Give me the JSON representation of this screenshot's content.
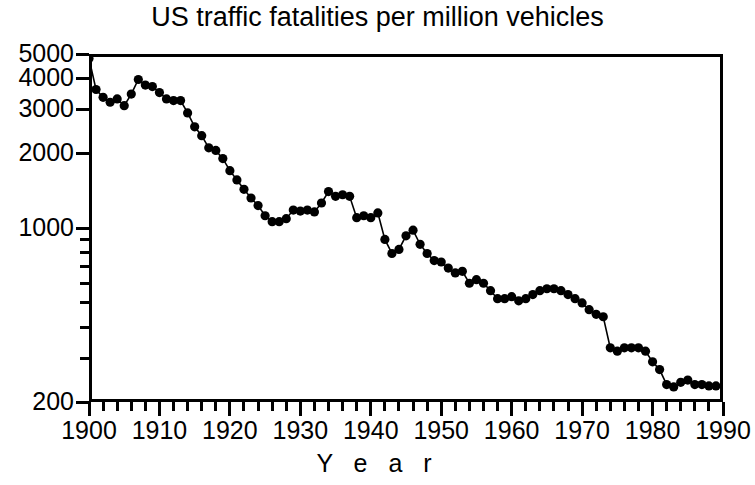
{
  "chart": {
    "title": "US traffic fatalities per million vehicles",
    "xlabel": "Y e a r",
    "ylabel": ""
  },
  "chart_data": {
    "type": "line",
    "title": "US traffic fatalities per million vehicles",
    "xlabel": "Y e a r",
    "ylabel": "",
    "yscale": "log",
    "ylim": [
      200,
      5000
    ],
    "xlim": [
      1900,
      1990
    ],
    "grid": false,
    "legend": false,
    "marker": "filled-circle",
    "line_color": "#000000",
    "marker_color": "#000000",
    "y_ticks_major": [
      5000,
      4000,
      3000,
      2000,
      1000,
      200
    ],
    "y_ticks_major_labels": [
      "5000",
      "4000",
      "3000",
      "2000",
      "1000",
      "200"
    ],
    "y_ticks_minor": [
      900,
      800,
      700,
      600,
      500,
      400,
      300
    ],
    "x_ticks_major": [
      1900,
      1910,
      1920,
      1930,
      1940,
      1950,
      1960,
      1970,
      1980,
      1990
    ],
    "x_ticks_major_labels": [
      "1900",
      "1910",
      "1920",
      "1930",
      "1940",
      "1950",
      "1960",
      "1970",
      "1980",
      "1990"
    ],
    "x_tick_minor_step": 2,
    "x": [
      1900,
      1901,
      1902,
      1903,
      1904,
      1905,
      1906,
      1907,
      1908,
      1909,
      1910,
      1911,
      1912,
      1913,
      1914,
      1915,
      1916,
      1917,
      1918,
      1919,
      1920,
      1921,
      1922,
      1923,
      1924,
      1925,
      1926,
      1927,
      1928,
      1929,
      1930,
      1931,
      1932,
      1933,
      1934,
      1935,
      1936,
      1937,
      1938,
      1939,
      1940,
      1941,
      1942,
      1943,
      1944,
      1945,
      1946,
      1947,
      1948,
      1949,
      1950,
      1951,
      1952,
      1953,
      1954,
      1955,
      1956,
      1957,
      1958,
      1959,
      1960,
      1961,
      1962,
      1963,
      1964,
      1965,
      1966,
      1967,
      1968,
      1969,
      1970,
      1971,
      1972,
      1973,
      1974,
      1975,
      1976,
      1977,
      1978,
      1979,
      1980,
      1981,
      1982,
      1983,
      1984,
      1985,
      1986,
      1987,
      1988,
      1989
    ],
    "y": [
      4800,
      3600,
      3350,
      3200,
      3300,
      3100,
      3450,
      3950,
      3750,
      3700,
      3500,
      3300,
      3250,
      3250,
      2900,
      2550,
      2350,
      2100,
      2050,
      1900,
      1700,
      1560,
      1430,
      1320,
      1230,
      1120,
      1060,
      1060,
      1090,
      1180,
      1170,
      1180,
      1160,
      1260,
      1400,
      1340,
      1360,
      1340,
      1100,
      1120,
      1100,
      1150,
      900,
      790,
      820,
      930,
      980,
      860,
      790,
      740,
      730,
      690,
      660,
      670,
      600,
      620,
      600,
      560,
      520,
      520,
      530,
      510,
      520,
      540,
      560,
      570,
      570,
      560,
      540,
      520,
      500,
      470,
      450,
      440,
      330,
      320,
      330,
      330,
      330,
      320,
      290,
      270,
      235,
      230,
      240,
      245,
      235,
      235,
      232,
      232
    ]
  }
}
